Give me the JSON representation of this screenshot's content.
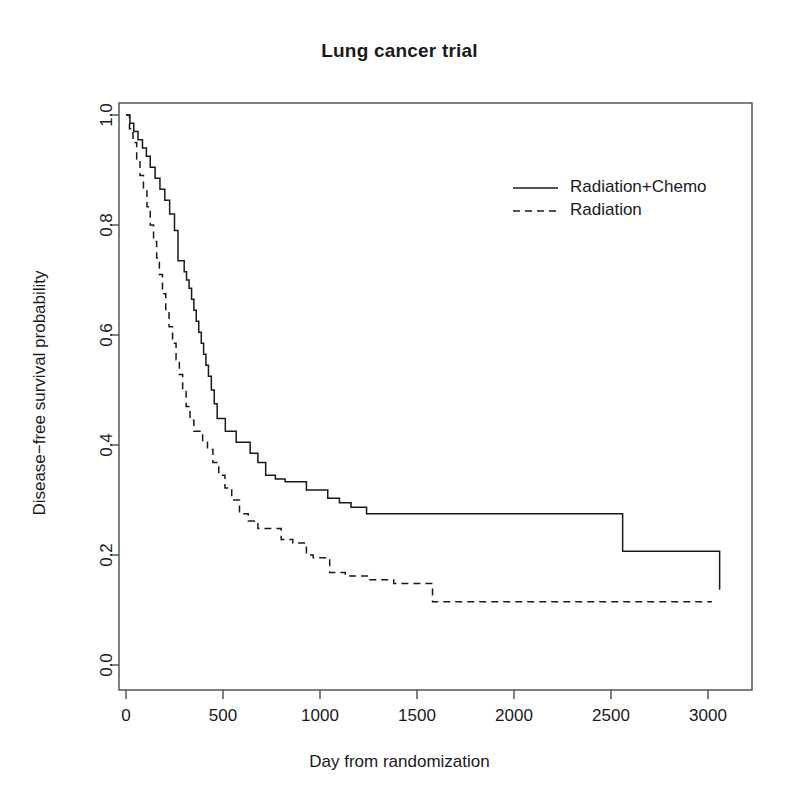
{
  "chart_data": {
    "type": "line",
    "title": "Lung cancer trial",
    "xlabel": "Day from randomization",
    "ylabel": "Disease−free survival probability",
    "xlim": [
      -60,
      3120
    ],
    "ylim": [
      0.0,
      1.0
    ],
    "grid": false,
    "legend_position": "top-right",
    "xticks": [
      0,
      500,
      1000,
      1500,
      2000,
      2500,
      3000
    ],
    "xtick_labels": [
      "0",
      "500",
      "1000",
      "1500",
      "2000",
      "2500",
      "3000"
    ],
    "yticks": [
      0.0,
      0.2,
      0.4,
      0.6,
      0.8,
      1.0
    ],
    "ytick_labels": [
      "0.0",
      "0.2",
      "0.4",
      "0.6",
      "0.8",
      "1.0"
    ],
    "step_type": "post",
    "series": [
      {
        "name": "Radiation+Chemo",
        "style": "solid",
        "color": "#1a1a1a",
        "x": [
          0,
          20,
          40,
          62,
          85,
          105,
          125,
          150,
          175,
          200,
          225,
          250,
          268,
          285,
          300,
          312,
          325,
          338,
          350,
          362,
          375,
          388,
          400,
          412,
          425,
          440,
          455,
          470,
          490,
          512,
          540,
          568,
          600,
          640,
          680,
          720,
          770,
          820,
          870,
          930,
          985,
          1040,
          1100,
          1160,
          1240,
          2370,
          2560,
          3060
        ],
        "y": [
          1.0,
          0.985,
          0.97,
          0.955,
          0.94,
          0.925,
          0.905,
          0.885,
          0.865,
          0.845,
          0.82,
          0.79,
          0.735,
          0.735,
          0.715,
          0.7,
          0.685,
          0.665,
          0.645,
          0.625,
          0.605,
          0.585,
          0.565,
          0.545,
          0.525,
          0.5,
          0.475,
          0.448,
          0.448,
          0.425,
          0.425,
          0.405,
          0.405,
          0.385,
          0.368,
          0.345,
          0.338,
          0.333,
          0.333,
          0.318,
          0.318,
          0.303,
          0.295,
          0.287,
          0.275,
          0.275,
          0.207,
          0.137
        ]
      },
      {
        "name": "Radiation",
        "style": "dashed",
        "color": "#1a1a1a",
        "x": [
          0,
          18,
          36,
          55,
          72,
          90,
          108,
          125,
          142,
          158,
          172,
          188,
          205,
          222,
          240,
          258,
          275,
          292,
          310,
          330,
          350,
          372,
          395,
          420,
          448,
          478,
          510,
          545,
          585,
          630,
          680,
          740,
          800,
          860,
          930,
          965,
          1050,
          1130,
          1250,
          1380,
          1580,
          3020
        ],
        "y": [
          1.0,
          0.975,
          0.95,
          0.92,
          0.89,
          0.862,
          0.833,
          0.8,
          0.77,
          0.74,
          0.71,
          0.675,
          0.645,
          0.615,
          0.585,
          0.555,
          0.528,
          0.5,
          0.47,
          0.445,
          0.425,
          0.425,
          0.405,
          0.392,
          0.368,
          0.345,
          0.322,
          0.3,
          0.275,
          0.262,
          0.248,
          0.248,
          0.228,
          0.222,
          0.2,
          0.195,
          0.168,
          0.162,
          0.155,
          0.148,
          0.115,
          0.115
        ]
      }
    ]
  },
  "legend": {
    "entries": [
      {
        "label": "Radiation+Chemo",
        "style": "solid"
      },
      {
        "label": "Radiation",
        "style": "dashed"
      }
    ]
  },
  "axes": {
    "frame_color": "#4a4a4a"
  }
}
